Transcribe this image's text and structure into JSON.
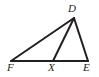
{
  "figure": {
    "kind": "geometry-diagram",
    "background_color": "#ffffff",
    "stroke_color": "#231f20",
    "stroke_width": 2,
    "canvas": {
      "width": 99,
      "height": 77
    },
    "points": {
      "D": {
        "label": "D",
        "x": 74,
        "y": 18
      },
      "F": {
        "label": "F",
        "x": 11,
        "y": 61
      },
      "X": {
        "label": "X",
        "x": 53,
        "y": 61
      },
      "E": {
        "label": "E",
        "x": 88,
        "y": 61
      }
    },
    "segments": [
      {
        "name": "base-FE",
        "from": "F",
        "to": "E"
      },
      {
        "name": "side-FD",
        "from": "F",
        "to": "D"
      },
      {
        "name": "side-DE",
        "from": "D",
        "to": "E"
      },
      {
        "name": "cevian-DX",
        "from": "D",
        "to": "X"
      }
    ],
    "labels": {
      "apex": "D",
      "base_left": "F",
      "base_mid": "X",
      "base_right": "E"
    }
  }
}
